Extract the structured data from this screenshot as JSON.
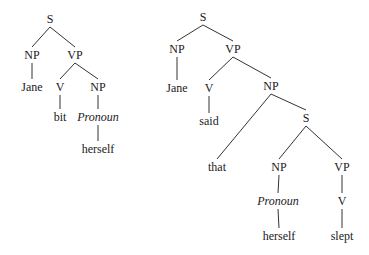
{
  "trees": [
    {
      "id": "tree-left",
      "nodes": [
        {
          "id": "S",
          "label": "S",
          "x": 50,
          "y": 23,
          "italic": false
        },
        {
          "id": "NP1",
          "label": "NP",
          "x": 32,
          "y": 59,
          "italic": false
        },
        {
          "id": "VP",
          "label": "VP",
          "x": 75,
          "y": 59,
          "italic": false
        },
        {
          "id": "Jane",
          "label": "Jane",
          "x": 32,
          "y": 91,
          "italic": false
        },
        {
          "id": "V",
          "label": "V",
          "x": 60,
          "y": 91,
          "italic": false
        },
        {
          "id": "NP2",
          "label": "NP",
          "x": 98,
          "y": 91,
          "italic": false
        },
        {
          "id": "bit",
          "label": "bit",
          "x": 60,
          "y": 121,
          "italic": false
        },
        {
          "id": "Pron",
          "label": "Pronoun",
          "x": 98,
          "y": 121,
          "italic": true
        },
        {
          "id": "herself",
          "label": "herself",
          "x": 98,
          "y": 153,
          "italic": false
        }
      ],
      "edges": [
        [
          "S",
          "NP1"
        ],
        [
          "S",
          "VP"
        ],
        [
          "NP1",
          "Jane"
        ],
        [
          "VP",
          "V"
        ],
        [
          "VP",
          "NP2"
        ],
        [
          "V",
          "bit"
        ],
        [
          "NP2",
          "Pron"
        ],
        [
          "Pron",
          "herself"
        ]
      ]
    },
    {
      "id": "tree-right",
      "nodes": [
        {
          "id": "S",
          "label": "S",
          "x": 203,
          "y": 21,
          "italic": false
        },
        {
          "id": "NP1",
          "label": "NP",
          "x": 177,
          "y": 53,
          "italic": false
        },
        {
          "id": "VP",
          "label": "VP",
          "x": 233,
          "y": 53,
          "italic": false
        },
        {
          "id": "Jane",
          "label": "Jane",
          "x": 177,
          "y": 92,
          "italic": false
        },
        {
          "id": "V",
          "label": "V",
          "x": 209,
          "y": 92,
          "italic": false
        },
        {
          "id": "NP2",
          "label": "NP",
          "x": 271,
          "y": 90,
          "italic": false
        },
        {
          "id": "said",
          "label": "said",
          "x": 209,
          "y": 125,
          "italic": false
        },
        {
          "id": "S2",
          "label": "S",
          "x": 306,
          "y": 122,
          "italic": false
        },
        {
          "id": "that",
          "label": "that",
          "x": 217,
          "y": 171,
          "italic": false
        },
        {
          "id": "NP3",
          "label": "NP",
          "x": 279,
          "y": 171,
          "italic": false
        },
        {
          "id": "VP2",
          "label": "VP",
          "x": 342,
          "y": 171,
          "italic": false
        },
        {
          "id": "Pron",
          "label": "Pronoun",
          "x": 278,
          "y": 205,
          "italic": true
        },
        {
          "id": "V2",
          "label": "V",
          "x": 342,
          "y": 205,
          "italic": false
        },
        {
          "id": "herself",
          "label": "herself",
          "x": 279,
          "y": 240,
          "italic": false
        },
        {
          "id": "slept",
          "label": "slept",
          "x": 342,
          "y": 240,
          "italic": false
        }
      ],
      "edges": [
        [
          "S",
          "NP1"
        ],
        [
          "S",
          "VP"
        ],
        [
          "NP1",
          "Jane"
        ],
        [
          "VP",
          "V"
        ],
        [
          "VP",
          "NP2"
        ],
        [
          "V",
          "said"
        ],
        [
          "NP2",
          "that"
        ],
        [
          "NP2",
          "S2"
        ],
        [
          "S2",
          "NP3"
        ],
        [
          "S2",
          "VP2"
        ],
        [
          "NP3",
          "Pron"
        ],
        [
          "Pron",
          "herself"
        ],
        [
          "VP2",
          "V2"
        ],
        [
          "V2",
          "slept"
        ]
      ]
    }
  ]
}
